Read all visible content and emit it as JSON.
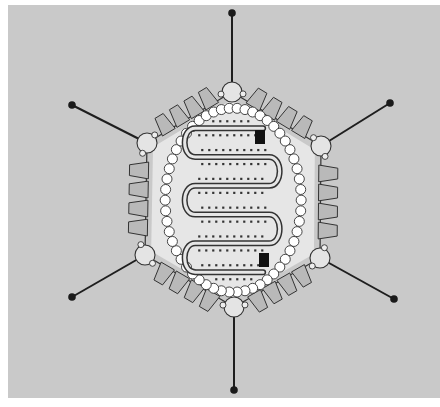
{
  "diagram": {
    "colors": {
      "page": "#ffffff",
      "background": "#c9c9c9",
      "capsid_interior": "#e6e6e6",
      "hexon_fill": "#b9b9b9",
      "line": "#333333",
      "knob": "#1a1a1a",
      "bead": "#ffffff",
      "terminal_protein": "#111111"
    },
    "hexagon": {
      "vertices": [
        [
          232,
          92
        ],
        [
          321,
          146
        ],
        [
          320,
          258
        ],
        [
          234,
          307
        ],
        [
          145,
          255
        ],
        [
          147,
          143
        ]
      ]
    },
    "fibers": [
      {
        "from": [
          232,
          92
        ],
        "to": [
          232,
          13
        ]
      },
      {
        "from": [
          321,
          146
        ],
        "to": [
          390,
          103
        ]
      },
      {
        "from": [
          320,
          258
        ],
        "to": [
          394,
          299
        ]
      },
      {
        "from": [
          234,
          307
        ],
        "to": [
          234,
          390
        ]
      },
      {
        "from": [
          145,
          255
        ],
        "to": [
          72,
          297
        ]
      },
      {
        "from": [
          147,
          143
        ],
        "to": [
          72,
          105
        ]
      }
    ],
    "terminal_proteins": [
      {
        "x": 255,
        "y": 130,
        "w": 10,
        "h": 14
      },
      {
        "x": 259,
        "y": 253,
        "w": 10,
        "h": 14
      }
    ]
  }
}
